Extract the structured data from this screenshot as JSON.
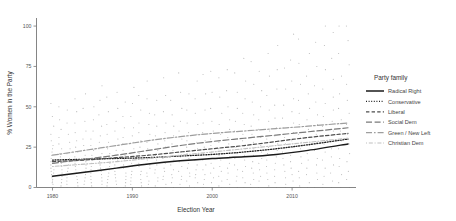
{
  "chart_data": {
    "type": "scatter",
    "title": "",
    "xlabel": "Election Year",
    "ylabel": "% Women in the Party",
    "xlim": [
      1978,
      2018
    ],
    "ylim": [
      0,
      105
    ],
    "xticks": [
      1980,
      1990,
      2000,
      2010
    ],
    "yticks": [
      0,
      25,
      50,
      75,
      100
    ],
    "grid": false,
    "legend_position": "right",
    "legend_title": "Party family",
    "series": [
      {
        "name": "Radical Right",
        "style": "solid",
        "color": "#1a1a1a",
        "width": 1.5,
        "x": [
          1980,
          1984,
          1988,
          1992,
          1996,
          2000,
          2004,
          2008,
          2012,
          2017
        ],
        "values": [
          7.0,
          9.5,
          12.0,
          14.5,
          16.5,
          18.0,
          19.0,
          20.5,
          23.0,
          27.0
        ]
      },
      {
        "name": "Conservative",
        "style": "dotted",
        "color": "#222222",
        "width": 1.3,
        "x": [
          1980,
          1984,
          1988,
          1992,
          1996,
          2000,
          2004,
          2008,
          2012,
          2017
        ],
        "values": [
          17.0,
          17.5,
          18.0,
          18.5,
          19.5,
          20.5,
          22.0,
          24.0,
          26.5,
          30.0
        ]
      },
      {
        "name": "Liberal",
        "style": "dashed",
        "color": "#4d4d4d",
        "width": 1.2,
        "x": [
          1980,
          1984,
          1988,
          1992,
          1996,
          2000,
          2004,
          2008,
          2012,
          2017
        ],
        "values": [
          16.0,
          17.0,
          18.5,
          20.0,
          22.0,
          24.0,
          26.0,
          28.5,
          31.0,
          33.5
        ]
      },
      {
        "name": "Social Dem",
        "style": "longdash",
        "color": "#7a7a7a",
        "width": 1.2,
        "x": [
          1980,
          1984,
          1988,
          1992,
          1996,
          2000,
          2004,
          2008,
          2012,
          2017
        ],
        "values": [
          15.0,
          17.5,
          20.0,
          23.0,
          26.0,
          28.5,
          30.5,
          32.5,
          34.5,
          37.0
        ]
      },
      {
        "name": "Green / New Left",
        "style": "twodash",
        "color": "#9e9e9e",
        "width": 1.2,
        "x": [
          1980,
          1984,
          1988,
          1992,
          1996,
          2000,
          2004,
          2008,
          2012,
          2017
        ],
        "values": [
          20.0,
          23.0,
          26.0,
          29.0,
          31.5,
          33.5,
          35.0,
          36.5,
          38.0,
          40.0
        ]
      },
      {
        "name": "Christian Dem",
        "style": "dotdash",
        "color": "#bfbfbf",
        "width": 1.1,
        "x": [
          1980,
          1984,
          1988,
          1992,
          1996,
          2000,
          2004,
          2008,
          2012,
          2017
        ],
        "values": [
          13.0,
          14.5,
          16.0,
          18.0,
          20.0,
          22.0,
          24.0,
          26.0,
          28.0,
          30.5
        ]
      }
    ],
    "scatter": {
      "color": "#8c8c8c",
      "radius": 0.55,
      "opacity": 0.62,
      "note": "Observations grouped in vertical columns by election year",
      "columns": [
        {
          "x": 1980,
          "y": [
            0,
            0,
            0,
            2,
            3,
            4,
            5,
            6,
            7,
            8,
            9,
            10,
            11,
            12,
            14,
            15,
            16,
            17,
            18,
            20,
            22,
            24,
            26,
            29,
            33,
            38,
            44,
            52
          ]
        },
        {
          "x": 1981,
          "y": [
            0,
            1,
            3,
            5,
            7,
            9,
            11,
            13,
            15,
            17,
            19,
            21,
            24,
            27,
            31,
            36,
            42,
            50
          ]
        },
        {
          "x": 1982,
          "y": [
            0,
            2,
            4,
            6,
            8,
            10,
            12,
            14,
            16,
            18,
            21,
            24,
            28,
            33,
            40,
            48
          ]
        },
        {
          "x": 1983,
          "y": [
            0,
            0,
            1,
            3,
            5,
            7,
            9,
            11,
            13,
            15,
            17,
            19,
            22,
            25,
            29,
            34,
            40,
            47,
            55
          ]
        },
        {
          "x": 1984,
          "y": [
            0,
            2,
            4,
            6,
            8,
            10,
            12,
            14,
            16,
            18,
            20,
            23,
            26,
            30,
            35,
            41,
            49,
            58
          ]
        },
        {
          "x": 1985,
          "y": [
            0,
            1,
            3,
            5,
            7,
            9,
            11,
            13,
            15,
            17,
            20,
            23,
            26,
            30,
            35,
            42,
            50
          ]
        },
        {
          "x": 1986,
          "y": [
            0,
            0,
            2,
            4,
            6,
            8,
            10,
            12,
            14,
            16,
            18,
            21,
            24,
            28,
            32,
            38,
            45,
            54,
            63
          ]
        },
        {
          "x": 1987,
          "y": [
            0,
            1,
            3,
            5,
            7,
            9,
            11,
            13,
            15,
            18,
            21,
            24,
            28,
            33,
            39,
            47,
            56
          ]
        },
        {
          "x": 1988,
          "y": [
            0,
            2,
            4,
            6,
            8,
            10,
            12,
            14,
            17,
            20,
            23,
            26,
            30,
            35,
            41,
            49,
            59
          ]
        },
        {
          "x": 1989,
          "y": [
            0,
            0,
            1,
            3,
            5,
            7,
            9,
            12,
            14,
            17,
            20,
            23,
            27,
            31,
            37,
            44,
            53
          ]
        },
        {
          "x": 1990,
          "y": [
            0,
            2,
            4,
            6,
            8,
            10,
            13,
            15,
            18,
            21,
            24,
            28,
            32,
            37,
            44,
            52,
            62
          ]
        },
        {
          "x": 1991,
          "y": [
            0,
            1,
            3,
            5,
            8,
            10,
            13,
            15,
            18,
            21,
            25,
            29,
            34,
            40,
            48,
            57
          ]
        },
        {
          "x": 1992,
          "y": [
            0,
            0,
            2,
            4,
            7,
            9,
            12,
            14,
            17,
            20,
            24,
            28,
            33,
            39,
            46,
            55,
            66
          ]
        },
        {
          "x": 1993,
          "y": [
            0,
            1,
            4,
            6,
            9,
            11,
            14,
            17,
            20,
            23,
            27,
            32,
            38,
            45,
            54
          ]
        },
        {
          "x": 1994,
          "y": [
            0,
            2,
            5,
            7,
            10,
            12,
            15,
            18,
            21,
            25,
            29,
            34,
            40,
            47,
            57,
            68
          ]
        },
        {
          "x": 1995,
          "y": [
            0,
            0,
            3,
            6,
            8,
            11,
            14,
            17,
            20,
            23,
            27,
            32,
            38,
            45,
            54
          ]
        },
        {
          "x": 1996,
          "y": [
            0,
            2,
            5,
            7,
            10,
            13,
            16,
            19,
            22,
            26,
            30,
            35,
            41,
            49,
            59,
            71
          ]
        },
        {
          "x": 1997,
          "y": [
            0,
            1,
            4,
            7,
            9,
            12,
            15,
            18,
            21,
            25,
            29,
            34,
            40,
            48,
            58
          ]
        },
        {
          "x": 1998,
          "y": [
            0,
            3,
            6,
            8,
            11,
            14,
            17,
            20,
            24,
            28,
            33,
            39,
            46,
            55,
            66
          ]
        },
        {
          "x": 1999,
          "y": [
            0,
            0,
            2,
            5,
            8,
            11,
            14,
            17,
            21,
            25,
            29,
            34,
            40,
            48,
            58,
            70
          ]
        },
        {
          "x": 2000,
          "y": [
            0,
            3,
            6,
            9,
            12,
            15,
            18,
            22,
            26,
            30,
            35,
            41,
            49,
            59,
            72
          ]
        },
        {
          "x": 2001,
          "y": [
            0,
            1,
            4,
            7,
            10,
            13,
            17,
            20,
            24,
            28,
            33,
            39,
            46,
            56,
            68
          ]
        },
        {
          "x": 2002,
          "y": [
            0,
            2,
            5,
            9,
            12,
            15,
            19,
            23,
            27,
            31,
            36,
            42,
            50,
            60,
            73
          ]
        },
        {
          "x": 2003,
          "y": [
            0,
            0,
            4,
            7,
            11,
            14,
            18,
            21,
            25,
            30,
            35,
            41,
            49,
            59,
            71
          ]
        },
        {
          "x": 2004,
          "y": [
            0,
            3,
            6,
            10,
            13,
            17,
            20,
            24,
            29,
            33,
            39,
            46,
            55,
            66,
            80
          ]
        },
        {
          "x": 2005,
          "y": [
            0,
            2,
            5,
            9,
            12,
            16,
            20,
            24,
            28,
            33,
            38,
            45,
            53,
            64,
            78
          ]
        },
        {
          "x": 2006,
          "y": [
            0,
            4,
            7,
            11,
            15,
            18,
            22,
            26,
            31,
            36,
            42,
            50,
            60,
            72
          ]
        },
        {
          "x": 2007,
          "y": [
            0,
            1,
            5,
            9,
            13,
            17,
            21,
            25,
            30,
            35,
            41,
            48,
            57,
            69,
            83
          ]
        },
        {
          "x": 2008,
          "y": [
            0,
            3,
            7,
            11,
            15,
            19,
            23,
            27,
            32,
            37,
            43,
            51,
            61,
            73,
            88
          ]
        },
        {
          "x": 2009,
          "y": [
            0,
            2,
            6,
            10,
            14,
            18,
            22,
            27,
            31,
            37,
            43,
            51,
            61,
            74
          ]
        },
        {
          "x": 2010,
          "y": [
            0,
            4,
            8,
            12,
            16,
            20,
            25,
            29,
            34,
            40,
            47,
            55,
            66,
            79,
            95
          ]
        },
        {
          "x": 2011,
          "y": [
            0,
            1,
            6,
            10,
            15,
            19,
            24,
            28,
            33,
            39,
            46,
            54,
            64,
            77,
            92
          ]
        },
        {
          "x": 2012,
          "y": [
            0,
            3,
            8,
            12,
            17,
            21,
            26,
            31,
            36,
            42,
            49,
            58,
            69,
            83
          ]
        },
        {
          "x": 2013,
          "y": [
            0,
            5,
            9,
            14,
            18,
            23,
            28,
            33,
            39,
            45,
            53,
            63,
            75,
            90
          ]
        },
        {
          "x": 2014,
          "y": [
            0,
            2,
            7,
            12,
            17,
            22,
            27,
            32,
            38,
            44,
            52,
            61,
            73,
            88,
            100
          ]
        },
        {
          "x": 2015,
          "y": [
            0,
            4,
            9,
            14,
            19,
            24,
            29,
            35,
            41,
            48,
            56,
            67,
            80,
            96
          ]
        },
        {
          "x": 2016,
          "y": [
            0,
            3,
            8,
            13,
            18,
            24,
            29,
            35,
            42,
            49,
            58,
            69,
            83,
            100
          ]
        },
        {
          "x": 2017,
          "y": [
            0,
            5,
            10,
            16,
            21,
            27,
            33,
            39,
            46,
            54,
            64,
            76,
            91,
            100
          ]
        }
      ]
    }
  }
}
